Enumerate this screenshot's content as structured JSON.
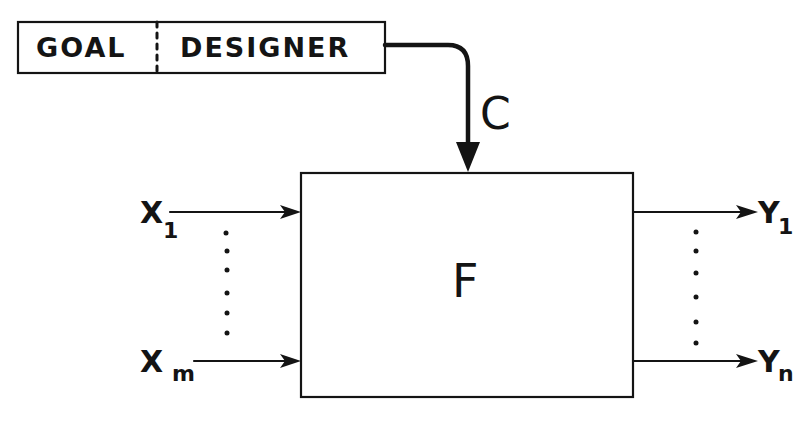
{
  "diagram": {
    "designer_box": {
      "left_label": "GOAL",
      "right_label": "DESIGNER"
    },
    "control_signal": {
      "label": "C"
    },
    "system_block": {
      "label": "F"
    },
    "inputs": [
      {
        "symbol": "X",
        "subscript": "1"
      },
      {
        "symbol": "X",
        "subscript": "m"
      }
    ],
    "outputs": [
      {
        "symbol": "Y",
        "subscript": "1"
      },
      {
        "symbol": "Y",
        "subscript": "n"
      }
    ],
    "stroke_color": "#141414",
    "background_color": "#ffffff"
  }
}
